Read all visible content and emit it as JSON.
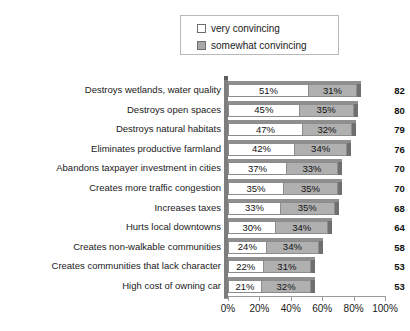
{
  "chart_data": {
    "type": "bar",
    "orientation": "horizontal",
    "stacked": true,
    "title": "",
    "xlabel": "",
    "ylabel": "",
    "xlim": [
      0,
      100
    ],
    "grid": false,
    "legend_position": "top-center",
    "categories": [
      "Destroys wetlands, water quality",
      "Destroys open spaces",
      "Destroys natural habitats",
      "Eliminates productive farmland",
      "Abandons taxpayer investment in cities",
      "Creates more traffic congestion",
      "Increases taxes",
      "Hurts local downtowns",
      "Creates non-walkable communities",
      "Creates communities that lack character",
      "High cost of owning car"
    ],
    "series": [
      {
        "name": "very convincing",
        "color": "#ffffff",
        "values": [
          51,
          45,
          47,
          42,
          37,
          35,
          33,
          30,
          24,
          22,
          21
        ],
        "labels": [
          "51%",
          "45%",
          "47%",
          "42%",
          "37%",
          "35%",
          "33%",
          "30%",
          "24%",
          "22%",
          "21%"
        ]
      },
      {
        "name": "somewhat convincing",
        "color": "#b0b0b0",
        "values": [
          31,
          35,
          32,
          34,
          33,
          35,
          35,
          34,
          34,
          31,
          32
        ],
        "labels": [
          "31%",
          "35%",
          "32%",
          "34%",
          "33%",
          "35%",
          "35%",
          "34%",
          "34%",
          "31%",
          "32%"
        ]
      }
    ],
    "totals": [
      82,
      80,
      79,
      76,
      70,
      70,
      68,
      64,
      58,
      53,
      53
    ],
    "xticks": [
      0,
      20,
      40,
      60,
      80,
      100
    ],
    "xtick_labels": [
      "0%",
      "20%",
      "40%",
      "60%",
      "80%",
      "100%"
    ]
  },
  "legend": {
    "items": [
      {
        "label": "very convincing",
        "swatch": "white-square-icon"
      },
      {
        "label": "somewhat convincing",
        "swatch": "gray-square-icon"
      }
    ]
  }
}
